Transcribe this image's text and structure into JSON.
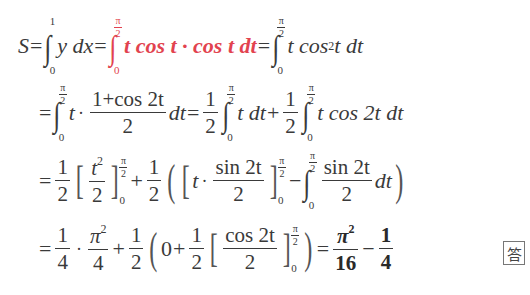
{
  "document": {
    "type": "math-solution",
    "colors": {
      "text": "#3a3a3a",
      "highlight": "#e2434f"
    },
    "lines": [
      {
        "id": "line1",
        "latex": "S=\\int_0^1 y\\,dx=\\int_0^{\\frac{\\pi}{2}} t\\cos t\\cdot\\cos t\\,dt=\\int_0^{\\frac{\\pi}{2}} t\\cos^2 t\\,dt",
        "parts": {
          "S": "S",
          "eq": "=",
          "int1_upper": "1",
          "int1_lower": "0",
          "int1_body": "y dx",
          "int2_upper_num": "π",
          "int2_upper_den": "2",
          "int2_lower": "0",
          "int2_body_red": "t cos t · cos t dt",
          "int3_upper_num": "π",
          "int3_upper_den": "2",
          "int3_lower": "0",
          "int3_body_a": "t cos",
          "int3_body_sup": "2",
          "int3_body_b": " t dt"
        }
      },
      {
        "id": "line2",
        "latex": "=\\int_0^{\\frac{\\pi}{2}} t\\cdot\\frac{1+\\cos 2t}{2}dt=\\frac12\\int_0^{\\frac{\\pi}{2}} t\\,dt+\\frac12\\int_0^{\\frac{\\pi}{2}} t\\cos 2t\\,dt",
        "parts": {
          "eq": "=",
          "pi": "π",
          "two": "2",
          "zero": "0",
          "t": "t",
          "frac1_num": "1+cos 2t",
          "frac1_den": "2",
          "dt": "dt",
          "half_num": "1",
          "half_den": "2",
          "body_a": "t dt",
          "plus": "+",
          "body_b": "t cos 2t dt"
        }
      },
      {
        "id": "line3",
        "latex": "=\\frac12\\left[\\frac{t^2}{2}\\right]_0^{\\frac{\\pi}{2}}+\\frac12\\left(\\left[t\\cdot\\frac{\\sin 2t}{2}\\right]_0^{\\frac{\\pi}{2}}-\\int_0^{\\frac{\\pi}{2}}\\frac{\\sin 2t}{2}dt\\right)",
        "parts": {
          "eq": "=",
          "half_num": "1",
          "half_den": "2",
          "t2_num": "t",
          "t2_sup": "2",
          "t2_den": "2",
          "pi": "π",
          "two": "2",
          "zero": "0",
          "plus": "+",
          "t": "t",
          "sin_num": "sin 2t",
          "sin_den": "2",
          "minus": "−",
          "dt": "dt"
        }
      },
      {
        "id": "line4",
        "latex": "=\\frac14\\cdot\\frac{\\pi^2}{4}+\\frac12\\left(0+\\frac12\\left[\\frac{\\cos 2t}{2}\\right]_0^{\\frac{\\pi}{2}}\\right)=\\frac{\\pi^2}{16}-\\frac14",
        "parts": {
          "eq": "=",
          "q_num": "1",
          "q_den": "4",
          "pi2_num": "π",
          "pi2_sup": "2",
          "pi2_den": "4",
          "plus": "+",
          "half_num": "1",
          "half_den": "2",
          "zero": "0",
          "cos_num": "cos 2t",
          "cos_den": "2",
          "pi": "π",
          "two": "2",
          "ans1_num": "π",
          "ans1_sup": "2",
          "ans1_den": "16",
          "minus": "−",
          "ans2_num": "1",
          "ans2_den": "4"
        }
      }
    ],
    "answer_mark": "答"
  }
}
